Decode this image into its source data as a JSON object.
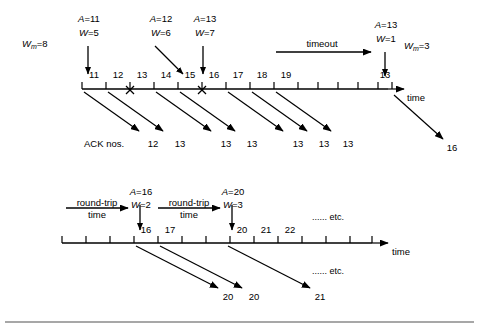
{
  "figure": {
    "title_present": false,
    "background": "#ffffff",
    "ink": "#000000",
    "bottom_rule": true
  },
  "diagram_top": {
    "name": "go-back-n-timeout-diagram",
    "window_max_label": {
      "var": "W",
      "sub": "m",
      "value": "8",
      "text": "W"
    },
    "window_max_text": "=8",
    "events": [
      {
        "a_label": "A",
        "a_value": "=11",
        "w_label": "W",
        "w_value": "=5",
        "arrow": "straight-down"
      },
      {
        "a_label": "A",
        "a_value": "=12",
        "w_label": "W",
        "w_value": "=6",
        "arrow": "diagonal-down-right"
      },
      {
        "a_label": "A",
        "a_value": "=13",
        "w_label": "W",
        "w_value": "=7",
        "arrow": "straight-down"
      },
      {
        "a_label": "A",
        "a_value": "=13",
        "w_label": "W",
        "w_value": "=1",
        "arrow": "straight-down"
      }
    ],
    "timeout_label": "timeout",
    "wm_after_timeout": {
      "text": "W",
      "sub": "m",
      "value": "=3"
    },
    "axis_label": "time",
    "segment_numbers": [
      "11",
      "12",
      "13",
      "14",
      "15",
      "16",
      "17",
      "18",
      "19"
    ],
    "retransmit_number": "13",
    "lost_segments": [
      "13",
      "16"
    ],
    "lost_marker": "X",
    "ack_caption": "ACK nos.",
    "ack_numbers": [
      "12",
      "13",
      "13",
      "13",
      "13",
      "13",
      "13"
    ],
    "final_ack": "16"
  },
  "diagram_bottom": {
    "name": "slow-start-round-trip-diagram",
    "rtt_labels": [
      {
        "line1": "round-trip",
        "line2": "time"
      },
      {
        "line1": "round-trip",
        "line2": "time"
      }
    ],
    "events": [
      {
        "a_label": "A",
        "a_value": "=16",
        "w_label": "W",
        "w_value": "=2"
      },
      {
        "a_label": "A",
        "a_value": "=20",
        "w_label": "W",
        "w_value": "=3"
      }
    ],
    "segment_numbers": [
      "16",
      "17",
      "20",
      "21",
      "22"
    ],
    "axis_label": "time",
    "etc_top": "...... etc.",
    "etc_bottom": "...... etc.",
    "ack_numbers": [
      "20",
      "20",
      "21"
    ]
  }
}
